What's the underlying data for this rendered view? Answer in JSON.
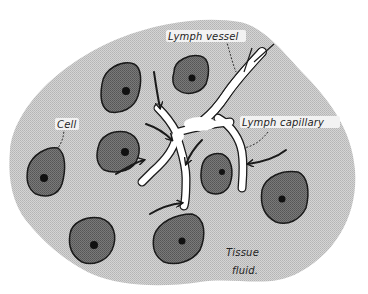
{
  "diagram": {
    "type": "biology-illustration",
    "labels": {
      "lymph_vessel": "Lymph vessel",
      "lymph_capillary": "Lymph capillary",
      "cell": "Cell",
      "tissue": "Tissue",
      "fluid": "fluid."
    },
    "colors": {
      "tissue_fluid": "#c8c8c8",
      "cell_body": "#6e6e6e",
      "cell_outline": "#1a1a1a",
      "nucleus": "#111111",
      "vessel": "#ffffff",
      "vessel_outline": "#1a1a1a",
      "arrow": "#1a1a1a",
      "background": "#ffffff"
    },
    "cell_count": 10,
    "arrow_count": 8
  }
}
